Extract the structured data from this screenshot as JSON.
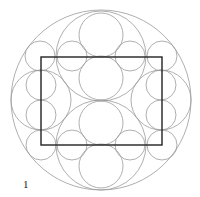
{
  "figure": {
    "label": "1",
    "stroke_color": "#9a9a9a",
    "rect_color": "#222222",
    "outer_circle": {
      "cx": 101,
      "cy": 100,
      "r": 90
    },
    "rectangle": {
      "x": 41,
      "y": 57,
      "w": 121,
      "h": 88
    },
    "circles": [
      {
        "cx": 101,
        "cy": 35,
        "r": 22
      },
      {
        "cx": 101,
        "cy": 78,
        "r": 22
      },
      {
        "cx": 101,
        "cy": 123,
        "r": 22
      },
      {
        "cx": 101,
        "cy": 166,
        "r": 22
      },
      {
        "cx": 101,
        "cy": 56,
        "r": 45
      },
      {
        "cx": 101,
        "cy": 145,
        "r": 45
      },
      {
        "cx": 41,
        "cy": 100,
        "r": 30
      },
      {
        "cx": 161,
        "cy": 100,
        "r": 30
      },
      {
        "cx": 41,
        "cy": 85,
        "r": 15
      },
      {
        "cx": 41,
        "cy": 115,
        "r": 15
      },
      {
        "cx": 161,
        "cy": 85,
        "r": 15
      },
      {
        "cx": 161,
        "cy": 115,
        "r": 15
      },
      {
        "cx": 40,
        "cy": 56,
        "r": 15
      },
      {
        "cx": 72,
        "cy": 56,
        "r": 15
      },
      {
        "cx": 130,
        "cy": 56,
        "r": 15
      },
      {
        "cx": 162,
        "cy": 56,
        "r": 15
      },
      {
        "cx": 41,
        "cy": 145,
        "r": 15
      },
      {
        "cx": 72,
        "cy": 145,
        "r": 15
      },
      {
        "cx": 130,
        "cy": 145,
        "r": 15
      },
      {
        "cx": 162,
        "cy": 145,
        "r": 15
      }
    ]
  }
}
